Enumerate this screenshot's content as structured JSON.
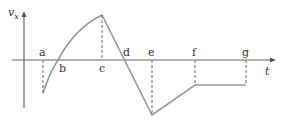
{
  "diagram": {
    "y_axis_label": "v",
    "y_axis_subscript": "x",
    "x_axis_label": "t",
    "points": [
      {
        "name": "a",
        "label": "a"
      },
      {
        "name": "b",
        "label": "b"
      },
      {
        "name": "c",
        "label": "c"
      },
      {
        "name": "d",
        "label": "d"
      },
      {
        "name": "e",
        "label": "e"
      },
      {
        "name": "f",
        "label": "f"
      },
      {
        "name": "g",
        "label": "g"
      }
    ],
    "colors": {
      "axis": "#666666",
      "curve": "#9a9a9a",
      "dash": "#666666"
    }
  }
}
